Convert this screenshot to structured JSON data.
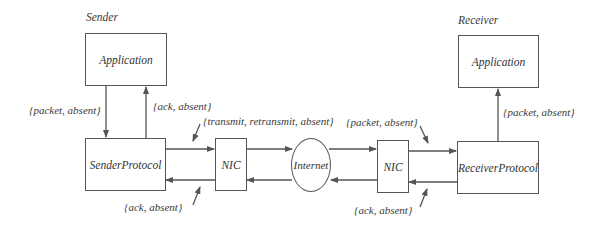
{
  "sender": {
    "title": "Sender",
    "application": "Application",
    "protocol": "SenderProtocol",
    "nic": "NIC"
  },
  "receiver": {
    "title": "Receiver",
    "application": "Application",
    "protocol": "ReceiverProtocol",
    "nic": "NIC"
  },
  "network": {
    "internet": "Internet"
  },
  "labels": {
    "sender_app_to_protocol": "{packet, absent}",
    "sender_protocol_to_app": "{ack, absent}",
    "sender_protocol_to_nic": "{transmit, retransmit, absent}",
    "sender_nic_to_protocol": "{ack, absent}",
    "receiver_nic_to_protocol": "{packet, absent}",
    "receiver_protocol_to_nic": "{ack, absent}",
    "receiver_protocol_to_app": "{packet, absent}"
  },
  "colors": {
    "line": "#555555",
    "text": "#333333",
    "background": "#ffffff"
  }
}
